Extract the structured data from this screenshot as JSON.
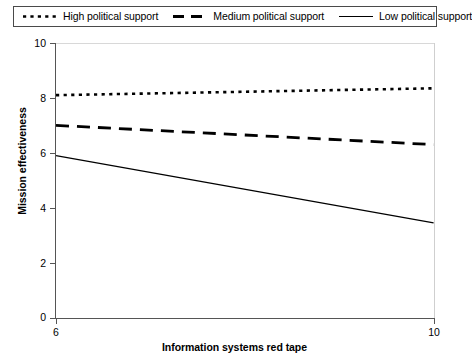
{
  "chart_data": {
    "type": "line",
    "title": "",
    "xlabel": "Information systems red tape",
    "ylabel": "Mission effectiveness",
    "xlim": [
      6,
      10
    ],
    "ylim": [
      0,
      10
    ],
    "xticks": [
      "6",
      "10"
    ],
    "yticks": [
      "0",
      "2",
      "4",
      "6",
      "8",
      "10"
    ],
    "grid": false,
    "legend_position": "top",
    "x": [
      6,
      10
    ],
    "series": [
      {
        "name": "High political support",
        "style": "dotted",
        "color": "#000000",
        "values": [
          8.1,
          8.35
        ]
      },
      {
        "name": "Medium political support",
        "style": "dashed",
        "color": "#000000",
        "values": [
          7.0,
          6.3
        ]
      },
      {
        "name": "Low political support",
        "style": "solid",
        "color": "#000000",
        "values": [
          5.9,
          3.45
        ]
      }
    ]
  },
  "legend": {
    "entries": [
      {
        "label": "High political support",
        "sample": "dotted-line-sample"
      },
      {
        "label": "Medium political support",
        "sample": "dashed-line-sample"
      },
      {
        "label": "Low political support",
        "sample": "solid-line-sample"
      }
    ]
  },
  "axes": {
    "y_title": "Mission effectiveness",
    "x_title": "Information systems red tape",
    "y_tick_labels": [
      "10",
      "8",
      "6",
      "4",
      "2",
      "0"
    ],
    "x_tick_labels": [
      "6",
      "10"
    ]
  }
}
